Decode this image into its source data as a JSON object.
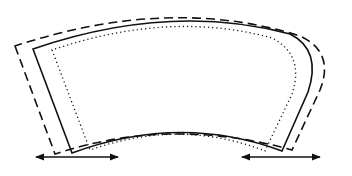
{
  "diagram": {
    "colors": {
      "stroke": "#111111",
      "background": "#ffffff"
    },
    "outlines": [
      {
        "name": "dashed-outline",
        "style": "dashed",
        "path": "M 15 46 L 55 154 Q 170 116 292 150 L 320 90 Q 335 52 300 36 Q 170 -5 15 46 Z"
      },
      {
        "name": "solid-outline",
        "style": "solid",
        "path": "M 33 49 L 72 153 Q 180 113 282 151 L 308 92 Q 322 50 290 34 Q 170 2 33 49 Z"
      },
      {
        "name": "dotted-outline",
        "style": "dotted",
        "path": "M 52 50 L 90 150 Q 180 118 265 151 L 292 94 Q 305 55 272 38 Q 170 10 52 50 Z"
      }
    ],
    "arrows": [
      {
        "name": "left-double-arrow",
        "x1": 36,
        "x2": 118,
        "y": 157
      },
      {
        "name": "right-double-arrow",
        "x1": 242,
        "x2": 320,
        "y": 157
      }
    ]
  }
}
